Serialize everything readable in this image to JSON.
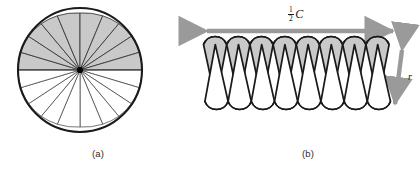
{
  "figure": {
    "panels": [
      {
        "id": "a",
        "caption": "(a)",
        "kind": "circle-sectors",
        "description": "Circle divided into 16 equal sectors; upper half shaded gray, lower half white",
        "sector_count": 16,
        "shaded_sector_count": 8,
        "shaded_half": "top",
        "center": {
          "x": 80,
          "y": 70
        },
        "radius": 62,
        "colors": {
          "shaded_fill": "#c9c9c9",
          "unshaded_fill": "#ffffff",
          "outline": "#1a1a1a",
          "spoke": "#3b3b3b",
          "center_dot": "#000000"
        }
      },
      {
        "id": "b",
        "caption": "(b)",
        "kind": "unrolled-sectors",
        "description": "Sectors rearranged into an interleaved strip of alternating gray and white triangles",
        "triangle_pairs": 8,
        "gray_triangle_count": 8,
        "white_triangle_count": 8,
        "top_arc_count": 8,
        "bottom_arc_count": 8,
        "colors": {
          "shaded_fill": "#c9c9c9",
          "unshaded_fill": "#ffffff",
          "outline": "#1a1a1a",
          "arrow": "#9a9a9a"
        },
        "annotations": {
          "width_label": {
            "numerator": "1",
            "denominator": "2",
            "variable": "C",
            "text": "1/2 C"
          },
          "height_label": {
            "variable": "r",
            "text": "r"
          }
        }
      }
    ]
  }
}
